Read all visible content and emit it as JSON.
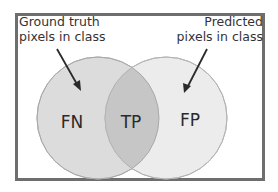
{
  "diagram": {
    "type": "venn",
    "labels": {
      "ground_truth_line1": "Ground truth",
      "ground_truth_line2": "pixels in class",
      "predicted_line1": "Predicted",
      "predicted_line2": "pixels in class"
    },
    "regions": {
      "fn": "FN",
      "tp": "TP",
      "fp": "FP"
    },
    "colors": {
      "frame_border": "#6e6e6e",
      "left_circle_fill": "#dcdcdc",
      "right_circle_fill": "#ececec",
      "overlap_fill": "#c6c6c6",
      "circle_stroke": "#b4b4b4",
      "arrow": "#2a2a2a",
      "text": "#2a2a2a"
    }
  }
}
